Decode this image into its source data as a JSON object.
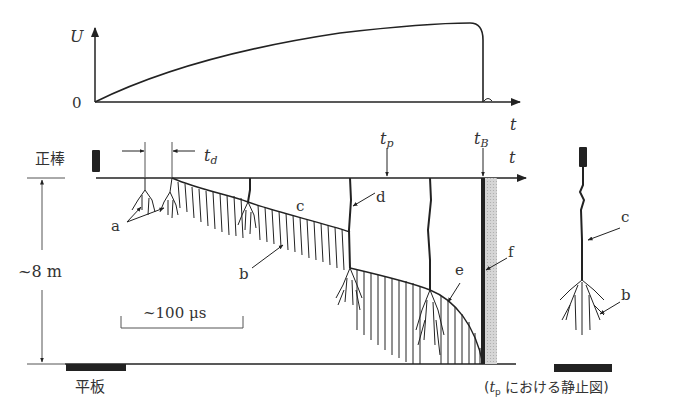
{
  "diagram": {
    "voltage_graph": {
      "y_axis_label": "U",
      "origin_label": "0",
      "x_axis_label": "t"
    },
    "streak_diagram": {
      "time_axis_label": "t",
      "rod_label": "正棒",
      "plate_label": "平板",
      "gap_label": "~8 m",
      "td_label": "t",
      "td_sub": "d",
      "tp_label": "t",
      "tp_sub": "p",
      "tb_label": "t",
      "tb_sub": "B",
      "scale_bar_label": "~100 μs",
      "markers": {
        "a": "a",
        "b": "b",
        "c": "c",
        "d": "d",
        "e": "e",
        "f": "f"
      }
    },
    "static_diagram": {
      "label_c": "c",
      "label_b": "b",
      "caption_open": "(",
      "caption_t": "t",
      "caption_sub": "p",
      "caption_text": " における静止図)"
    },
    "colors": {
      "line": "#222222",
      "gray_fill": "#c8c8c8"
    }
  }
}
